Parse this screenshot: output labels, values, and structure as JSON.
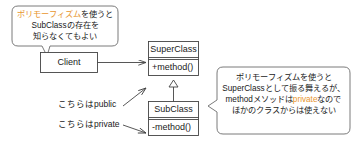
{
  "diagram": {
    "type": "uml-class-diagram",
    "colors": {
      "stroke": "#444444",
      "bubble_stroke": "#6b6b6b",
      "text": "#1a1a1a",
      "accent": "#e8962e",
      "background": "#ffffff"
    }
  },
  "bubbles": {
    "left": {
      "line1_accent": "ポリモーフィズム",
      "line1_rest": "を使うと",
      "line2": "SubClassの存在を",
      "line3": "知らなくてもよい"
    },
    "right": {
      "line1": "ポリモーフィズムを使うと",
      "line2": "SuperClassとして振る舞えるが、",
      "line3_pre": "methodメソッドは",
      "line3_accent": "private",
      "line3_post": "なので",
      "line4": "ほかのクラスからは使えない"
    }
  },
  "classes": {
    "client": {
      "name": "Client"
    },
    "superclass": {
      "name": "SuperClass",
      "member": "+method()"
    },
    "subclass": {
      "name": "SubClass",
      "member": "-method()"
    }
  },
  "annotations": {
    "public_label": "こちらはpublic",
    "private_label": "こちらはprivate"
  }
}
